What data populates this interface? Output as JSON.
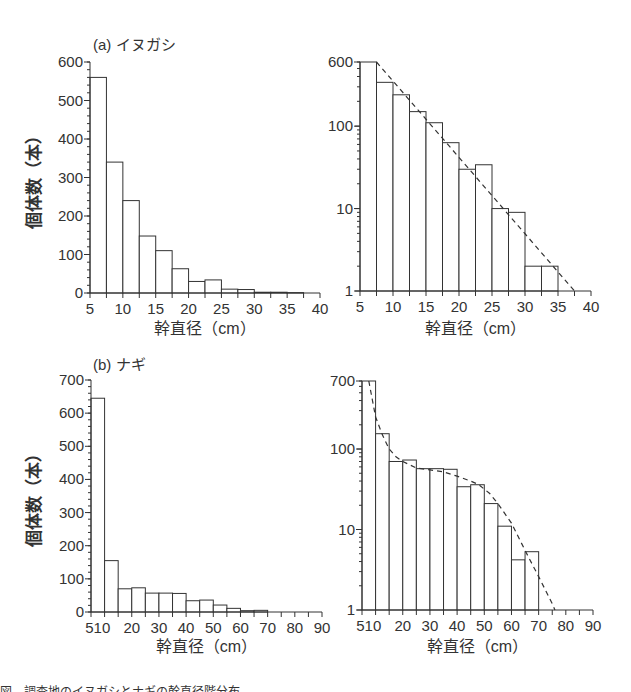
{
  "chart_data": [
    {
      "id": "a-linear",
      "type": "bar",
      "panel_label": "(a) イヌガシ",
      "title": "(a) イヌガシ",
      "xlabel": "幹直径（cm）",
      "ylabel": "個体数（本）",
      "xlim": [
        5,
        40
      ],
      "ylim": [
        0,
        600
      ],
      "yscale": "linear",
      "xticks": [
        5,
        10,
        15,
        20,
        25,
        30,
        35,
        40
      ],
      "yticks": [
        0,
        100,
        200,
        300,
        400,
        500,
        600
      ],
      "bin_width": 2.5,
      "bin_starts": [
        5,
        7.5,
        10,
        12.5,
        15,
        17.5,
        20,
        22.5,
        25,
        27.5,
        30,
        32.5,
        35,
        37.5
      ],
      "values": [
        560,
        340,
        240,
        148,
        110,
        63,
        30,
        34,
        10,
        9,
        2,
        2,
        1,
        0
      ]
    },
    {
      "id": "a-log",
      "type": "bar",
      "title": "",
      "xlabel": "幹直径（cm）",
      "ylabel": "",
      "xlim": [
        5,
        40
      ],
      "ylim": [
        1,
        600
      ],
      "yscale": "log",
      "xticks": [
        5,
        10,
        15,
        20,
        25,
        30,
        35,
        40
      ],
      "yticks": [
        1,
        10,
        100,
        600
      ],
      "bin_width": 2.5,
      "bin_starts": [
        5,
        7.5,
        10,
        12.5,
        15,
        17.5,
        20,
        22.5,
        25,
        27.5,
        30,
        32.5
      ],
      "values": [
        600,
        340,
        240,
        150,
        110,
        63,
        30,
        34,
        10,
        9,
        2,
        2
      ],
      "fit_line": {
        "style": "dashed",
        "points": [
          [
            7.5,
            600
          ],
          [
            37.5,
            1
          ]
        ]
      }
    },
    {
      "id": "b-linear",
      "type": "bar",
      "panel_label": "(b) ナギ",
      "title": "(b) ナギ",
      "xlabel": "幹直径（cm）",
      "ylabel": "個体数（本）",
      "xlim": [
        5,
        90
      ],
      "ylim": [
        0,
        700
      ],
      "yscale": "linear",
      "xticks": [
        5,
        10,
        20,
        30,
        40,
        50,
        60,
        70,
        80,
        90
      ],
      "yticks": [
        0,
        100,
        200,
        300,
        400,
        500,
        600,
        700
      ],
      "bin_starts": [
        5,
        10,
        15,
        20,
        25,
        30,
        35,
        40,
        45,
        50,
        55,
        60,
        65
      ],
      "bin_ends": [
        10,
        15,
        20,
        25,
        30,
        35,
        40,
        45,
        50,
        55,
        60,
        65,
        70
      ],
      "values": [
        645,
        155,
        70,
        73,
        57,
        57,
        56,
        34,
        36,
        21,
        11,
        4,
        5
      ]
    },
    {
      "id": "b-log",
      "type": "bar",
      "title": "",
      "xlabel": "幹直径（cm）",
      "ylabel": "",
      "xlim": [
        5,
        90
      ],
      "ylim": [
        1,
        700
      ],
      "yscale": "log",
      "xticks": [
        5,
        10,
        20,
        30,
        40,
        50,
        60,
        70,
        80,
        90
      ],
      "yticks": [
        1,
        10,
        100,
        700
      ],
      "bin_starts": [
        5,
        10,
        15,
        20,
        25,
        30,
        35,
        40,
        45,
        50,
        55,
        60,
        65
      ],
      "bin_ends": [
        10,
        15,
        20,
        25,
        30,
        35,
        40,
        45,
        50,
        55,
        60,
        65,
        70
      ],
      "values": [
        700,
        155,
        70,
        73,
        57,
        57,
        56,
        34,
        36,
        21,
        11,
        4.2,
        5.3
      ],
      "fit_line": {
        "style": "dashed",
        "points": [
          [
            7.5,
            700
          ],
          [
            10,
            250
          ],
          [
            12.5,
            150
          ],
          [
            15,
            100
          ],
          [
            17.5,
            80
          ],
          [
            20,
            70
          ],
          [
            25,
            58
          ],
          [
            30,
            55
          ],
          [
            35,
            52
          ],
          [
            40,
            46
          ],
          [
            45,
            40
          ],
          [
            48,
            36
          ],
          [
            52,
            28
          ],
          [
            55,
            21
          ],
          [
            60,
            12
          ],
          [
            65,
            5.5
          ],
          [
            70,
            2.6
          ],
          [
            75,
            1.2
          ],
          [
            76,
            1
          ]
        ]
      }
    }
  ],
  "labels": {
    "panel_a": "(a) イヌガシ",
    "panel_b": "(b) ナギ",
    "ylabel": "個体数（本）",
    "xlabel": "幹直径（cm）"
  },
  "caption": "図　調査地のイヌガシとナギの幹直径階分布"
}
